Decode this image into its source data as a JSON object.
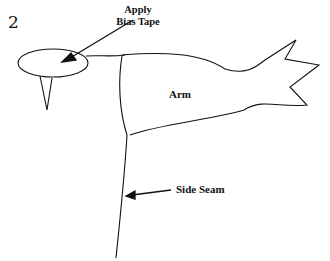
{
  "diagram": {
    "step_number": "2",
    "labels": {
      "apply_bias_tape": [
        "Apply",
        "Bias Tape"
      ],
      "arm": "Arm",
      "side_seam": "Side Seam"
    },
    "stroke_color": "#111111",
    "background": "#ffffff"
  }
}
